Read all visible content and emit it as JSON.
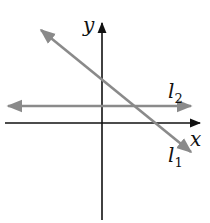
{
  "diagram": {
    "type": "coordinate-plane",
    "axes": {
      "x_label": "x",
      "y_label": "y",
      "color": "#111111"
    },
    "lines": [
      {
        "id": "l1",
        "label_main": "l",
        "label_sub": "1",
        "description": "line with negative slope, positive y-intercept, crossing positive x-axis",
        "color": "#8a8a8a"
      },
      {
        "id": "l2",
        "label_main": "l",
        "label_sub": "2",
        "description": "horizontal line above the x-axis",
        "color": "#8a8a8a"
      }
    ]
  }
}
